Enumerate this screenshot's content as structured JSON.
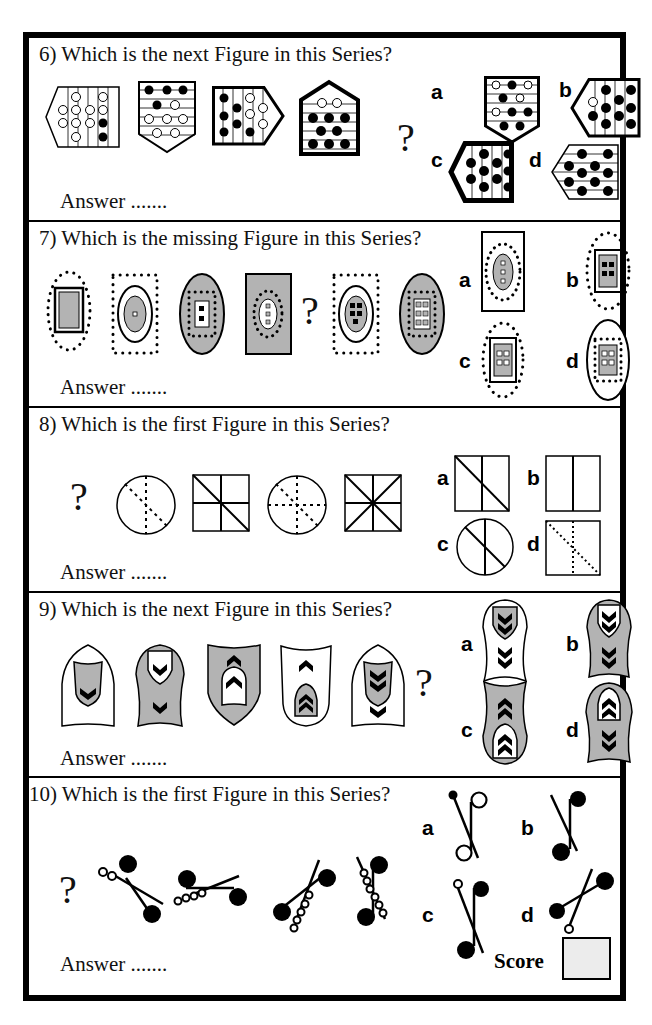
{
  "worksheet": {
    "questions": [
      {
        "number": 6,
        "title": "6) Which is the next Figure in this Series?",
        "answer_label": "Answer .......",
        "missing_marker": "?",
        "series": [
          "pentagon-left-vertical-stripes-circles",
          "shield-down-horizontal-stripes-circles",
          "pentagon-right-vertical-stripes-circles",
          "house-up-horizontal-stripes-circles"
        ],
        "options": [
          {
            "letter": "a",
            "figure": "shield-down-mixed-circles"
          },
          {
            "letter": "b",
            "figure": "pentagon-left-vertical-black-circles"
          },
          {
            "letter": "c",
            "figure": "thick-pentagon-left-vertical-black-circles"
          },
          {
            "letter": "d",
            "figure": "pentagon-left-horizontal-black-circles"
          }
        ]
      },
      {
        "number": 7,
        "title": "7) Which is the missing Figure in this Series?",
        "answer_label": "Answer .......",
        "missing_marker": "?",
        "series": [
          "dotted-oval-rect-gray",
          "dotted-rect-oval-gray-1-square",
          "gray-oval-dotted-rect-2-squares",
          "gray-rect-dotted-oval-3-squares",
          "?",
          "dotted-rect-oval-gray-5-squares",
          "gray-oval-dotted-rect-6-squares"
        ],
        "options": [
          {
            "letter": "a",
            "figure": "rect-dotted-oval-3-squares"
          },
          {
            "letter": "b",
            "figure": "dotted-oval-rect-4-squares"
          },
          {
            "letter": "c",
            "figure": "dotted-oval-rect-4-white-squares"
          },
          {
            "letter": "d",
            "figure": "oval-dotted-rect-4-white-squares"
          }
        ]
      },
      {
        "number": 8,
        "title": "8) Which is the first Figure in this Series?",
        "answer_label": "Answer .......",
        "missing_marker": "?",
        "series": [
          "?",
          "circle-dotted-2-lines",
          "square-3-lines",
          "circle-dotted-3-lines",
          "square-4-lines"
        ],
        "options": [
          {
            "letter": "a",
            "figure": "square-vertical-diagonal"
          },
          {
            "letter": "b",
            "figure": "square-vertical"
          },
          {
            "letter": "c",
            "figure": "circle-vertical-diagonal"
          },
          {
            "letter": "d",
            "figure": "square-dotted-vertical-diagonal"
          }
        ]
      },
      {
        "number": 9,
        "title": "9) Which is the next Figure in this Series?",
        "answer_label": "Answer .......",
        "missing_marker": "?",
        "series": [
          "arch-white-inner-gray-1-chevron",
          "arch-gray-inner-white-2-chevrons",
          "shield-gray-3-chevrons-up",
          "shield-white-4-chevrons-up",
          "arch-white-inner-gray-5-chevrons"
        ],
        "options": [
          {
            "letter": "a",
            "figure": "white-6-chevrons-down"
          },
          {
            "letter": "b",
            "figure": "gray-6-chevrons-down"
          },
          {
            "letter": "c",
            "figure": "gray-6-chevrons-up"
          },
          {
            "letter": "d",
            "figure": "gray-mixed-chevrons"
          }
        ]
      },
      {
        "number": 10,
        "title": "10) Which is the first Figure in this Series?",
        "answer_label": "Answer .......",
        "missing_marker": "?",
        "series": [
          "?",
          "note-2-rings",
          "note-3-rings",
          "note-4-rings",
          "note-5-rings"
        ],
        "options": [
          {
            "letter": "a",
            "figure": "note-open-heads"
          },
          {
            "letter": "b",
            "figure": "note-filled-heads"
          },
          {
            "letter": "c",
            "figure": "note-small-ring"
          },
          {
            "letter": "d",
            "figure": "note-diagonal-ring"
          }
        ]
      }
    ],
    "score_label": "Score",
    "colors": {
      "ink": "#000000",
      "gray_fill": "#b3b3b3",
      "score_box": "#ececec"
    }
  }
}
